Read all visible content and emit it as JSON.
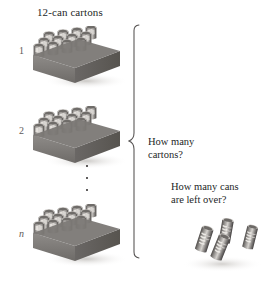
{
  "figure": {
    "title": "12-can cartons",
    "background_color": "#ffffff",
    "ink_color": "#241f1f"
  },
  "cartons": {
    "title": "12-can cartons",
    "cans_per_carton": 12,
    "items": [
      {
        "index_label": "1",
        "italic": false
      },
      {
        "index_label": "2",
        "italic": false
      },
      {
        "index_label": "n",
        "italic": true
      }
    ],
    "ellipsis_dots": 3
  },
  "questions": {
    "cartons_line1": "How many",
    "cartons_line2": "cartons?",
    "leftover_line1": "How many cans",
    "leftover_line2": "are left over?"
  },
  "leftover_cans": {
    "count": 4,
    "can_label": "Coke"
  }
}
